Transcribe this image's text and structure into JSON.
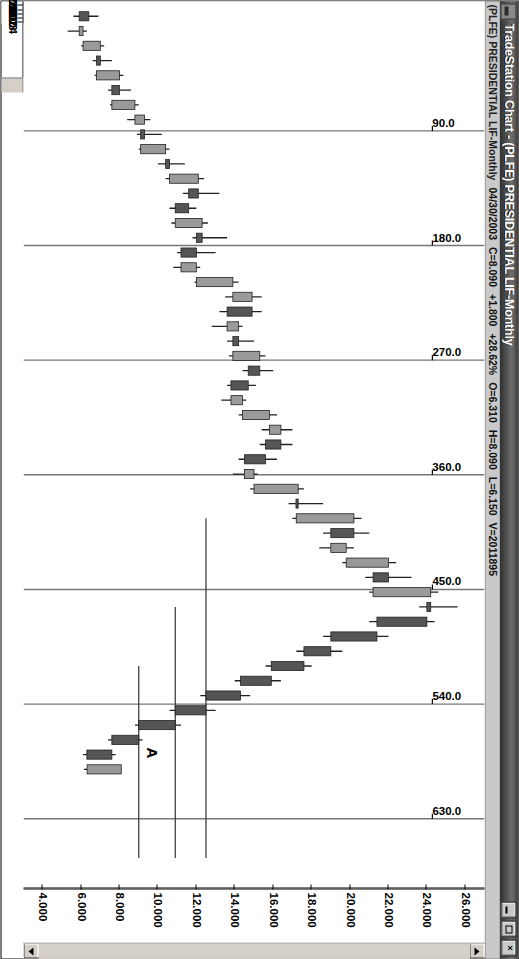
{
  "window": {
    "title": "TradeStation Chart - (PLFE) PRESIDENTIAL LIF-Monthly",
    "app_icon": "chart-icon",
    "minimize_label": "Minimize",
    "maximize_label": "Maximize",
    "close_label": "×"
  },
  "statusline": {
    "symbol": "(PLFE) PRESIDENTIAL LIF-Monthly",
    "date": "04/30/2003",
    "close": "C=8.090",
    "change": "+1.800",
    "change_pct": "+28.62%",
    "open": "O=6.310",
    "high": "H=8.090",
    "low": "L=6.150",
    "volume": "V=2011895"
  },
  "scrollbar": {
    "up_icon": "arrow-up-icon",
    "down_icon": "arrow-down-icon"
  },
  "chart_data": {
    "type": "candlestick",
    "title": "(PLFE) PRESIDENTIAL LIF-Monthly",
    "xlabel": "",
    "ylabel": "",
    "ylim": [
      3.0,
      27.0
    ],
    "grid": false,
    "legend": "none",
    "price_ticks": [
      "26.000",
      "24.000",
      "22.000",
      "20.000",
      "18.000",
      "16.000",
      "14.000",
      "12.000",
      "10.000",
      "8.000",
      "6.000",
      "4.000"
    ],
    "price_tick_values": [
      26.0,
      24.0,
      22.0,
      20.0,
      18.0,
      16.0,
      14.0,
      12.0,
      10.0,
      8.0,
      6.0,
      4.0
    ],
    "date_ticks": [
      "2000",
      "2001",
      "2002",
      "2003",
      "2004"
    ],
    "date_tick_x": [
      0.145,
      0.345,
      0.545,
      0.745,
      0.905
    ],
    "xlim_labels": [
      "1999",
      "2004"
    ],
    "annotations": {
      "anchor_label": "A",
      "gann_fan_labels": [
        "90.0",
        "180.0",
        "270.0",
        "360.0",
        "450.0",
        "540.0",
        "630.0"
      ],
      "gann_fan_values": [
        90.0,
        180.0,
        270.0,
        360.0,
        450.0,
        540.0,
        630.0
      ]
    },
    "colors": {
      "up_candle": "#9a9a9a",
      "down_candle": "#555555",
      "wick": "#222222",
      "axis": "#000000",
      "background": "#ffffff",
      "gann_line": "#777777",
      "titlebar": "#3a3a3a",
      "statusbar": "#c9c9c9"
    },
    "bars": [
      {
        "t": "1999-01",
        "o": 6.4,
        "h": 6.9,
        "l": 5.6,
        "c": 5.9,
        "dir": "down"
      },
      {
        "t": "1999-02",
        "o": 5.9,
        "h": 6.3,
        "l": 5.3,
        "c": 6.1,
        "dir": "up"
      },
      {
        "t": "1999-03",
        "o": 6.1,
        "h": 7.2,
        "l": 6.0,
        "c": 7.0,
        "dir": "up"
      },
      {
        "t": "1999-04",
        "o": 7.0,
        "h": 7.6,
        "l": 6.6,
        "c": 6.8,
        "dir": "down"
      },
      {
        "t": "1999-05",
        "o": 6.8,
        "h": 8.2,
        "l": 6.7,
        "c": 8.0,
        "dir": "up"
      },
      {
        "t": "1999-06",
        "o": 8.0,
        "h": 8.6,
        "l": 7.4,
        "c": 7.6,
        "dir": "down"
      },
      {
        "t": "1999-07",
        "o": 7.6,
        "h": 9.0,
        "l": 7.5,
        "c": 8.8,
        "dir": "up"
      },
      {
        "t": "1999-08",
        "o": 8.8,
        "h": 9.6,
        "l": 8.4,
        "c": 9.3,
        "dir": "up"
      },
      {
        "t": "1999-09",
        "o": 9.3,
        "h": 10.2,
        "l": 8.9,
        "c": 9.1,
        "dir": "down"
      },
      {
        "t": "1999-10",
        "o": 9.1,
        "h": 10.6,
        "l": 9.0,
        "c": 10.4,
        "dir": "up"
      },
      {
        "t": "1999-11",
        "o": 10.4,
        "h": 11.4,
        "l": 10.0,
        "c": 10.6,
        "dir": "down"
      },
      {
        "t": "1999-12",
        "o": 10.6,
        "h": 12.4,
        "l": 10.4,
        "c": 12.1,
        "dir": "up"
      },
      {
        "t": "2000-01",
        "o": 12.1,
        "h": 13.2,
        "l": 11.3,
        "c": 11.6,
        "dir": "down"
      },
      {
        "t": "2000-02",
        "o": 11.6,
        "h": 12.0,
        "l": 10.6,
        "c": 10.9,
        "dir": "down"
      },
      {
        "t": "2000-03",
        "o": 10.9,
        "h": 12.6,
        "l": 10.7,
        "c": 12.3,
        "dir": "up"
      },
      {
        "t": "2000-04",
        "o": 12.3,
        "h": 13.6,
        "l": 11.8,
        "c": 12.0,
        "dir": "down"
      },
      {
        "t": "2000-05",
        "o": 12.0,
        "h": 13.0,
        "l": 11.0,
        "c": 11.2,
        "dir": "down"
      },
      {
        "t": "2000-06",
        "o": 11.2,
        "h": 12.2,
        "l": 10.8,
        "c": 12.0,
        "dir": "up"
      },
      {
        "t": "2000-07",
        "o": 12.0,
        "h": 14.2,
        "l": 11.9,
        "c": 13.9,
        "dir": "up"
      },
      {
        "t": "2000-08",
        "o": 13.9,
        "h": 15.4,
        "l": 13.5,
        "c": 14.9,
        "dir": "up"
      },
      {
        "t": "2000-09",
        "o": 14.9,
        "h": 15.4,
        "l": 13.2,
        "c": 13.6,
        "dir": "down"
      },
      {
        "t": "2000-10",
        "o": 13.6,
        "h": 14.4,
        "l": 12.8,
        "c": 14.2,
        "dir": "up"
      },
      {
        "t": "2000-11",
        "o": 14.2,
        "h": 15.0,
        "l": 13.6,
        "c": 13.9,
        "dir": "down"
      },
      {
        "t": "2000-12",
        "o": 13.9,
        "h": 15.6,
        "l": 13.7,
        "c": 15.3,
        "dir": "up"
      },
      {
        "t": "2001-01",
        "o": 15.3,
        "h": 16.0,
        "l": 14.4,
        "c": 14.7,
        "dir": "down"
      },
      {
        "t": "2001-02",
        "o": 14.7,
        "h": 15.1,
        "l": 13.6,
        "c": 13.8,
        "dir": "down"
      },
      {
        "t": "2001-03",
        "o": 13.8,
        "h": 14.6,
        "l": 13.3,
        "c": 14.4,
        "dir": "up"
      },
      {
        "t": "2001-04",
        "o": 14.4,
        "h": 16.2,
        "l": 14.2,
        "c": 15.8,
        "dir": "up"
      },
      {
        "t": "2001-05",
        "o": 15.8,
        "h": 17.0,
        "l": 15.4,
        "c": 16.4,
        "dir": "up"
      },
      {
        "t": "2001-06",
        "o": 16.4,
        "h": 17.0,
        "l": 15.3,
        "c": 15.6,
        "dir": "down"
      },
      {
        "t": "2001-07",
        "o": 15.6,
        "h": 16.2,
        "l": 14.2,
        "c": 14.5,
        "dir": "down"
      },
      {
        "t": "2001-08",
        "o": 14.5,
        "h": 15.2,
        "l": 13.9,
        "c": 15.0,
        "dir": "up"
      },
      {
        "t": "2001-09",
        "o": 15.0,
        "h": 17.6,
        "l": 14.8,
        "c": 17.3,
        "dir": "up"
      },
      {
        "t": "2001-10",
        "o": 17.3,
        "h": 18.6,
        "l": 16.8,
        "c": 17.2,
        "dir": "down"
      },
      {
        "t": "2001-11",
        "o": 17.2,
        "h": 20.6,
        "l": 17.0,
        "c": 20.2,
        "dir": "up"
      },
      {
        "t": "2001-12",
        "o": 20.2,
        "h": 21.0,
        "l": 18.6,
        "c": 19.0,
        "dir": "down"
      },
      {
        "t": "2002-01",
        "o": 19.0,
        "h": 20.2,
        "l": 18.4,
        "c": 19.8,
        "dir": "up"
      },
      {
        "t": "2002-02",
        "o": 19.8,
        "h": 22.4,
        "l": 19.6,
        "c": 22.0,
        "dir": "up"
      },
      {
        "t": "2002-03",
        "o": 22.0,
        "h": 23.2,
        "l": 20.8,
        "c": 21.2,
        "dir": "down"
      },
      {
        "t": "2002-04",
        "o": 21.2,
        "h": 24.6,
        "l": 21.0,
        "c": 24.2,
        "dir": "up"
      },
      {
        "t": "2002-05",
        "o": 24.2,
        "h": 25.6,
        "l": 23.6,
        "c": 24.0,
        "dir": "down"
      },
      {
        "t": "2002-06",
        "o": 24.0,
        "h": 24.4,
        "l": 21.0,
        "c": 21.4,
        "dir": "down"
      },
      {
        "t": "2002-07",
        "o": 21.4,
        "h": 22.0,
        "l": 18.6,
        "c": 19.0,
        "dir": "down"
      },
      {
        "t": "2002-08",
        "o": 19.0,
        "h": 19.6,
        "l": 17.2,
        "c": 17.6,
        "dir": "down"
      },
      {
        "t": "2002-09",
        "o": 17.6,
        "h": 18.0,
        "l": 15.6,
        "c": 15.9,
        "dir": "down"
      },
      {
        "t": "2002-10",
        "o": 15.9,
        "h": 16.4,
        "l": 14.0,
        "c": 14.3,
        "dir": "down"
      },
      {
        "t": "2002-11",
        "o": 14.3,
        "h": 14.8,
        "l": 12.2,
        "c": 12.5,
        "dir": "down"
      },
      {
        "t": "2002-12",
        "o": 12.5,
        "h": 13.0,
        "l": 10.6,
        "c": 10.9,
        "dir": "down"
      },
      {
        "t": "2003-01",
        "o": 10.9,
        "h": 11.2,
        "l": 8.8,
        "c": 9.0,
        "dir": "down"
      },
      {
        "t": "2003-02",
        "o": 9.0,
        "h": 9.2,
        "l": 7.4,
        "c": 7.6,
        "dir": "down"
      },
      {
        "t": "2003-03",
        "o": 7.6,
        "h": 7.8,
        "l": 6.1,
        "c": 6.3,
        "dir": "down"
      },
      {
        "t": "2003-04",
        "o": 6.31,
        "h": 8.09,
        "l": 6.15,
        "c": 8.09,
        "dir": "up"
      }
    ]
  }
}
